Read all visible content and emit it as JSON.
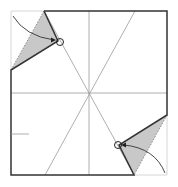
{
  "diagram": {
    "colors": {
      "background": "#ffffff",
      "edge": "#333333",
      "crease": "#999999",
      "shade": "#c8c8c8",
      "arrow": "#333333"
    },
    "square": {
      "x1": 11,
      "y1": 11,
      "x2": 167,
      "y2": 175
    },
    "center": {
      "x": 89,
      "y": 93
    },
    "flaps": [
      {
        "id": "top-left",
        "points": "44,11 58,41 11,70",
        "circle": {
          "cx": 60,
          "cy": 42,
          "r": 3.5
        }
      },
      {
        "id": "bottom-right",
        "points": "167,115 119,145 134,175",
        "circle": {
          "cx": 118,
          "cy": 145,
          "r": 3.5
        }
      }
    ],
    "tick": {
      "x1": 11,
      "y1": 134,
      "x2": 29,
      "y2": 134
    }
  }
}
